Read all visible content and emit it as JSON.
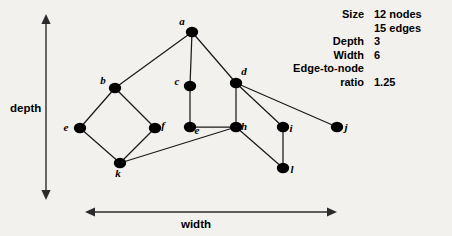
{
  "figure": {
    "background_color": "#f2f1ee",
    "ink_color": "#000000"
  },
  "axes": {
    "vertical": {
      "label": "depth",
      "label_x": 10,
      "label_y": 112,
      "x": 46,
      "y_top": 14,
      "y_bottom": 200
    },
    "horizontal": {
      "label": "width",
      "label_x": 196,
      "label_y": 228,
      "y": 212,
      "x_left": 85,
      "x_right": 337
    }
  },
  "stats": {
    "rows": [
      {
        "label": "Size",
        "value": "12 nodes"
      },
      {
        "label": "",
        "value": "15 edges"
      },
      {
        "label": "Depth",
        "value": "3"
      },
      {
        "label": "Width",
        "value": "6"
      },
      {
        "label": "Edge-to-node",
        "value": ""
      },
      {
        "label": "ratio",
        "value": "1.25"
      }
    ],
    "label_right_x": 364,
    "value_left_x": 374,
    "first_row_y": 18,
    "row_height": 13.5
  },
  "chart_data": {
    "type": "diagram",
    "title": "",
    "graph_kind": "undirected-node-link",
    "node_count": 12,
    "edge_count": 15,
    "depth": 3,
    "width": 6,
    "edge_to_node_ratio": 1.25,
    "nodes": [
      {
        "id": "a",
        "label": "a",
        "x": 192,
        "y": 32,
        "label_dx": -10,
        "label_dy": -7
      },
      {
        "id": "b",
        "label": "b",
        "x": 115,
        "y": 88,
        "label_dx": -12,
        "label_dy": -4
      },
      {
        "id": "c",
        "label": "c",
        "x": 190,
        "y": 86,
        "label_dx": -13,
        "label_dy": -1
      },
      {
        "id": "d",
        "label": "d",
        "x": 236,
        "y": 83,
        "label_dx": 8,
        "label_dy": -8
      },
      {
        "id": "e1",
        "label": "e",
        "x": 80,
        "y": 128,
        "label_dx": -14,
        "label_dy": 3
      },
      {
        "id": "f",
        "label": "f",
        "x": 155,
        "y": 128,
        "label_dx": 8,
        "label_dy": 1
      },
      {
        "id": "e2",
        "label": "e",
        "x": 190,
        "y": 127,
        "label_dx": 7,
        "label_dy": 7
      },
      {
        "id": "h",
        "label": "h",
        "x": 236,
        "y": 127,
        "label_dx": 8,
        "label_dy": 3
      },
      {
        "id": "i",
        "label": "i",
        "x": 283,
        "y": 127,
        "label_dx": 8,
        "label_dy": 5
      },
      {
        "id": "j",
        "label": "j",
        "x": 337,
        "y": 127,
        "label_dx": 9,
        "label_dy": 4
      },
      {
        "id": "k",
        "label": "k",
        "x": 120,
        "y": 163,
        "label_dx": -2,
        "label_dy": 14
      },
      {
        "id": "l",
        "label": "l",
        "x": 283,
        "y": 168,
        "label_dx": 9,
        "label_dy": 5
      }
    ],
    "edges": [
      {
        "from": "a",
        "to": "b"
      },
      {
        "from": "a",
        "to": "c"
      },
      {
        "from": "a",
        "to": "d"
      },
      {
        "from": "b",
        "to": "e1"
      },
      {
        "from": "b",
        "to": "f"
      },
      {
        "from": "e1",
        "to": "k"
      },
      {
        "from": "f",
        "to": "k"
      },
      {
        "from": "c",
        "to": "e2"
      },
      {
        "from": "e2",
        "to": "h"
      },
      {
        "from": "k",
        "to": "h"
      },
      {
        "from": "d",
        "to": "h"
      },
      {
        "from": "d",
        "to": "i"
      },
      {
        "from": "d",
        "to": "j"
      },
      {
        "from": "h",
        "to": "l"
      },
      {
        "from": "i",
        "to": "l"
      }
    ],
    "node_radius_x": 6.2,
    "node_radius_y": 5.2
  }
}
